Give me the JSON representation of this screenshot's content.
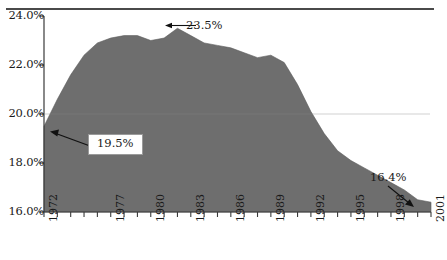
{
  "figure": {
    "background": "#ffffff",
    "rule_color": "#4a4a4a"
  },
  "chart_data": {
    "type": "area",
    "title": "",
    "subtitle": "",
    "xlabel": "",
    "ylabel": "",
    "grid": false,
    "legend": null,
    "fill_color": "#6e6e6e",
    "line_color": "#5c5c5c",
    "xlim": [
      1972,
      2001
    ],
    "ylim": [
      16.0,
      24.0
    ],
    "ytick_labels": [
      "24.0%",
      "22.0%",
      "20.0%",
      "18.0%",
      "16.0%"
    ],
    "ytick_values": [
      24.0,
      22.0,
      20.0,
      18.0,
      16.0
    ],
    "xtick_labels": [
      "1972",
      "1977",
      "1980",
      "1983",
      "1986",
      "1989",
      "1992",
      "1995",
      "1998",
      "2001"
    ],
    "xtick_values": [
      1972,
      1977,
      1980,
      1983,
      1986,
      1989,
      1992,
      1995,
      1998,
      2001
    ],
    "x": [
      1972,
      1973,
      1974,
      1975,
      1976,
      1977,
      1978,
      1979,
      1980,
      1981,
      1982,
      1983,
      1984,
      1985,
      1986,
      1987,
      1988,
      1989,
      1990,
      1991,
      1992,
      1993,
      1994,
      1995,
      1996,
      1997,
      1998,
      1999,
      2000,
      2001
    ],
    "values": [
      19.5,
      20.6,
      21.6,
      22.4,
      22.9,
      23.1,
      23.2,
      23.2,
      23.0,
      23.1,
      23.5,
      23.2,
      22.9,
      22.8,
      22.7,
      22.5,
      22.3,
      22.4,
      22.1,
      21.2,
      20.1,
      19.2,
      18.5,
      18.1,
      17.8,
      17.5,
      17.2,
      16.9,
      16.5,
      16.4
    ],
    "annotations": [
      {
        "label": "23.5%",
        "value": 23.5,
        "year": 1982,
        "style": "plain",
        "arrow": "left"
      },
      {
        "label": "19.5%",
        "value": 19.5,
        "year": 1972,
        "style": "boxed",
        "arrow": "left"
      },
      {
        "label": "16.4%",
        "value": 16.4,
        "year": 2001,
        "style": "plain",
        "arrow": "down-right"
      }
    ]
  }
}
